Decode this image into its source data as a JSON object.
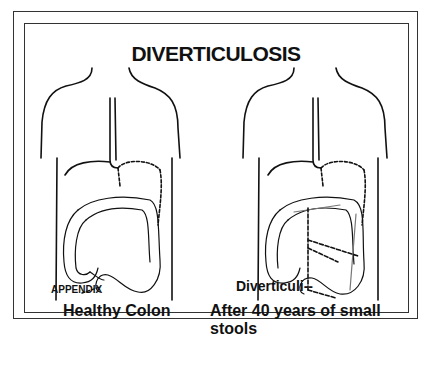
{
  "figure": {
    "title": "DIVERTICULOSIS",
    "panels": [
      {
        "caption": "Healthy Colon",
        "labels": [
          "APPENDIX"
        ]
      },
      {
        "caption": "After 40 years of small stools",
        "labels": [
          "Diverticuli--"
        ]
      }
    ]
  }
}
